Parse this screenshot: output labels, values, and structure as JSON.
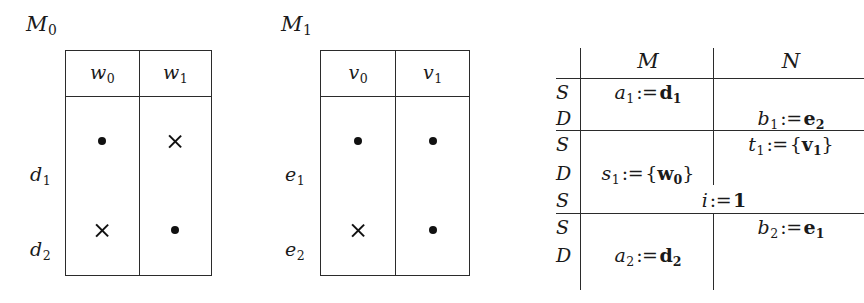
{
  "figure": {
    "kind": "three-panel-math-diagram",
    "ink_color": "#1a1a1a",
    "rule_color": "#2b2b2b"
  },
  "panels": {
    "left": {
      "caption": "M",
      "caption_sub": "0",
      "col_headers": [
        {
          "base": "w",
          "sub": "0"
        },
        {
          "base": "w",
          "sub": "1"
        }
      ],
      "row_labels": [
        {
          "base": "d",
          "sub": "1"
        },
        {
          "base": "d",
          "sub": "2"
        }
      ],
      "cells": [
        [
          "dot",
          "cross"
        ],
        [
          "cross",
          "dot"
        ]
      ]
    },
    "middle": {
      "caption": "M",
      "caption_sub": "1",
      "col_headers": [
        {
          "base": "v",
          "sub": "0"
        },
        {
          "base": "v",
          "sub": "1"
        }
      ],
      "row_labels": [
        {
          "base": "e",
          "sub": "1"
        },
        {
          "base": "e",
          "sub": "2"
        }
      ],
      "cells": [
        [
          "dot",
          "dot"
        ],
        [
          "cross",
          "dot"
        ]
      ]
    },
    "right": {
      "col_headers": [
        "M",
        "N"
      ],
      "marker_column_name": "S/D",
      "rows": [
        {
          "marker": "S",
          "column": "M",
          "text": "a_1 := d_1",
          "parts": {
            "lhs": "a",
            "lhs_sub": "1",
            "op": ":=",
            "rhs": "d",
            "rhs_sub": "1",
            "rhs_bold": true
          }
        },
        {
          "marker": "D",
          "column": "N",
          "text": "b_1 := e_2",
          "parts": {
            "lhs": "b",
            "lhs_sub": "1",
            "op": ":=",
            "rhs": "e",
            "rhs_sub": "2",
            "rhs_bold": true
          }
        },
        {
          "marker": "S",
          "column": "N",
          "text": "t_1 := {v_1}",
          "parts": {
            "lhs": "t",
            "lhs_sub": "1",
            "op": ":=",
            "rhs": "v",
            "rhs_sub": "1",
            "rhs_bold": true,
            "braces": true
          }
        },
        {
          "marker": "D",
          "column": "M",
          "text": "s_1 := {w_0}",
          "parts": {
            "lhs": "s",
            "lhs_sub": "1",
            "op": ":=",
            "rhs": "w",
            "rhs_sub": "0",
            "rhs_bold": true,
            "braces": true
          }
        },
        {
          "marker": "S",
          "column": "span",
          "text": "i := 1",
          "parts": {
            "lhs": "i",
            "lhs_sub": "",
            "op": ":=",
            "rhs": "1",
            "rhs_sub": "",
            "rhs_bold": true
          }
        },
        {
          "marker": "S",
          "column": "N",
          "text": "b_2 := e_1",
          "parts": {
            "lhs": "b",
            "lhs_sub": "2",
            "op": ":=",
            "rhs": "e",
            "rhs_sub": "1",
            "rhs_bold": true
          }
        },
        {
          "marker": "D",
          "column": "M",
          "text": "a_2 := d_2",
          "parts": {
            "lhs": "a",
            "lhs_sub": "2",
            "op": ":=",
            "rhs": "d",
            "rhs_sub": "2",
            "rhs_bold": true
          }
        }
      ],
      "group_breaks_after_row": [
        1,
        4
      ]
    },
    "glyphs": {
      "dot": "•",
      "cross": "×"
    }
  }
}
